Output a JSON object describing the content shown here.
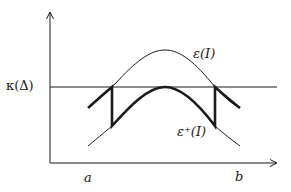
{
  "figure": {
    "labels": {
      "kappa": "κ(Δ)",
      "epsilon": "ε(I)",
      "epsilon_plus": "ε⁺(I)",
      "a": "a",
      "b": "b"
    },
    "colors": {
      "stroke": "#1a1a1a",
      "background": "#ffffff"
    },
    "axes": {
      "origin": [
        50,
        163
      ],
      "y_axis_top": 12,
      "x_axis_right": 277
    },
    "threshold_line_y": 87,
    "curves": {
      "epsilon": "upper thin bell curve peaking near x=165",
      "epsilon_plus": "lower thin bell curve",
      "thick_path": "piecewise curve: follows shifted segments, vertical jumps at crossings with κ(Δ)"
    }
  }
}
